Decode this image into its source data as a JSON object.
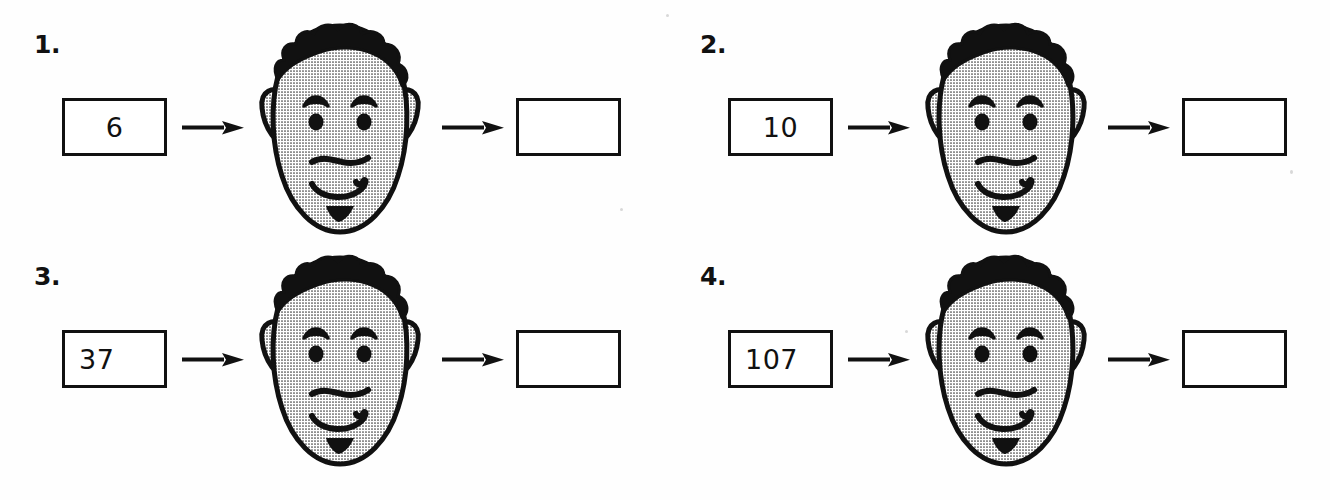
{
  "worksheet": {
    "title": "Function Machine Worksheet",
    "background_color": "#ffffff",
    "ink_color": "#111111",
    "face_fill_color": "#d9d9d9",
    "problems": [
      {
        "number_label": "1.",
        "input_value": "6",
        "output_value": "",
        "input_placeholder": "",
        "output_placeholder": "",
        "machine_icon": "cartoon-face-machine",
        "arrow_in_icon": "arrow-right-icon",
        "arrow_out_icon": "arrow-right-icon"
      },
      {
        "number_label": "2.",
        "input_value": "10",
        "output_value": "",
        "input_placeholder": "",
        "output_placeholder": "",
        "machine_icon": "cartoon-face-machine",
        "arrow_in_icon": "arrow-right-icon",
        "arrow_out_icon": "arrow-right-icon"
      },
      {
        "number_label": "3.",
        "input_value": "37",
        "output_value": "",
        "input_placeholder": "",
        "output_placeholder": "",
        "machine_icon": "cartoon-face-machine",
        "arrow_in_icon": "arrow-right-icon",
        "arrow_out_icon": "arrow-right-icon"
      },
      {
        "number_label": "4.",
        "input_value": "107",
        "output_value": "",
        "input_placeholder": "",
        "output_placeholder": "",
        "machine_icon": "cartoon-face-machine",
        "arrow_in_icon": "arrow-right-icon",
        "arrow_out_icon": "arrow-right-icon"
      }
    ]
  }
}
